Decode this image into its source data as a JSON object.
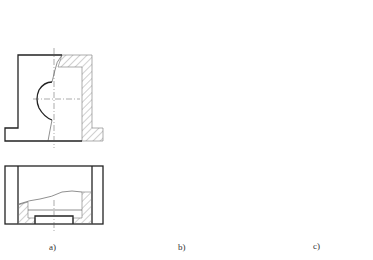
{
  "figure": {
    "panels": [
      {
        "id": "a",
        "label": "a)",
        "description": "Front view with local section (irregular break line) and top view with local section"
      },
      {
        "id": "b",
        "label": "b)",
        "description": "Front view with local section (wavy break line) and top view with stepped local section"
      },
      {
        "id": "c",
        "label": "c)",
        "description": "Isometric sectioned views of the bracket part"
      }
    ]
  },
  "colors": {
    "line": "#222222",
    "hatch": "#777777",
    "section_fill": "#d8d8d8",
    "background": "#ffffff"
  }
}
